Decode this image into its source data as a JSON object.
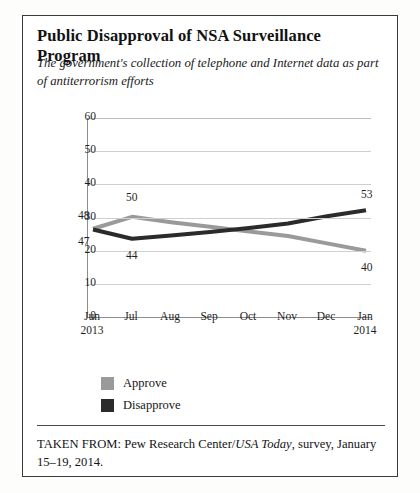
{
  "figure": {
    "title": "Public Disapproval of NSA Surveillance Program",
    "subtitle": "The government's collection of telephone and Internet data as part of antiterrorism efforts",
    "source_prefix": "TAKEN FROM: Pew Research Center/",
    "source_italic": "USA Today",
    "source_suffix": ", survey, January 15–19, 2014."
  },
  "chart_data": {
    "type": "line",
    "title": "Public Disapproval of NSA Surveillance Program",
    "subtitle": "The government's collection of telephone and Internet data as part of antiterrorism efforts",
    "xlabel": "",
    "ylabel": "",
    "ylim": [
      0,
      60
    ],
    "yticks": [
      0,
      10,
      20,
      30,
      40,
      50,
      60
    ],
    "grid": true,
    "legend_position": "below-left",
    "categories": [
      "Jun",
      "Jul",
      "Aug",
      "Sep",
      "Oct",
      "Nov",
      "Dec",
      "Jan"
    ],
    "category_years": [
      "2013",
      "",
      "",
      "",
      "",
      "",
      "",
      "2014"
    ],
    "series": [
      {
        "name": "Approve",
        "color": "#9a9a9a",
        "values": [
          48,
          50,
          null,
          null,
          null,
          null,
          null,
          40
        ],
        "plotted": [
          26.6,
          30.2,
          28.6,
          27.2,
          25.8,
          24.4,
          22.2,
          20.0
        ],
        "labels": [
          {
            "index": 0,
            "text": "48"
          },
          {
            "index": 1,
            "text": "50"
          },
          {
            "index": 7,
            "text": "40"
          }
        ]
      },
      {
        "name": "Disapprove",
        "color": "#2b2b2b",
        "values": [
          47,
          44,
          null,
          null,
          null,
          null,
          null,
          53
        ],
        "plotted": [
          26.4,
          23.6,
          24.6,
          25.6,
          26.8,
          28.2,
          30.4,
          32.2
        ],
        "labels": [
          {
            "index": 0,
            "text": "47"
          },
          {
            "index": 1,
            "text": "44"
          },
          {
            "index": 7,
            "text": "53"
          }
        ]
      }
    ]
  },
  "legend": {
    "items": [
      {
        "label": "Approve",
        "color": "#9a9a9a"
      },
      {
        "label": "Disapprove",
        "color": "#2b2b2b"
      }
    ]
  },
  "axis": {
    "y_tick_labels": [
      "60",
      "50",
      "40",
      "30",
      "20",
      "10",
      "0"
    ]
  }
}
